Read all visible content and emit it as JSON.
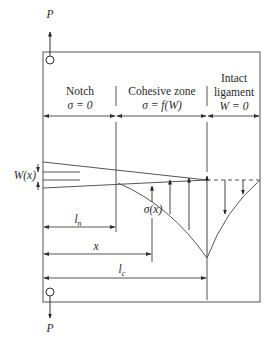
{
  "load": {
    "top_label": "P",
    "bottom_label": "P"
  },
  "zones": [
    {
      "title": "Notch",
      "condition": "σ = 0"
    },
    {
      "title": "Cohesive zone",
      "condition": "σ = f(W)"
    },
    {
      "title_line1": "Intact",
      "title_line2": "ligament",
      "condition": "W = 0"
    }
  ],
  "labels": {
    "opening": "W(x)",
    "stress": "σ(x)",
    "notch_length": "l",
    "notch_length_sub": "n",
    "position": "x",
    "critical_length": "l",
    "critical_length_sub": "c"
  },
  "colors": {
    "line": "#4a4a4a",
    "text": "#2a2a2a",
    "background": "#ffffff"
  }
}
